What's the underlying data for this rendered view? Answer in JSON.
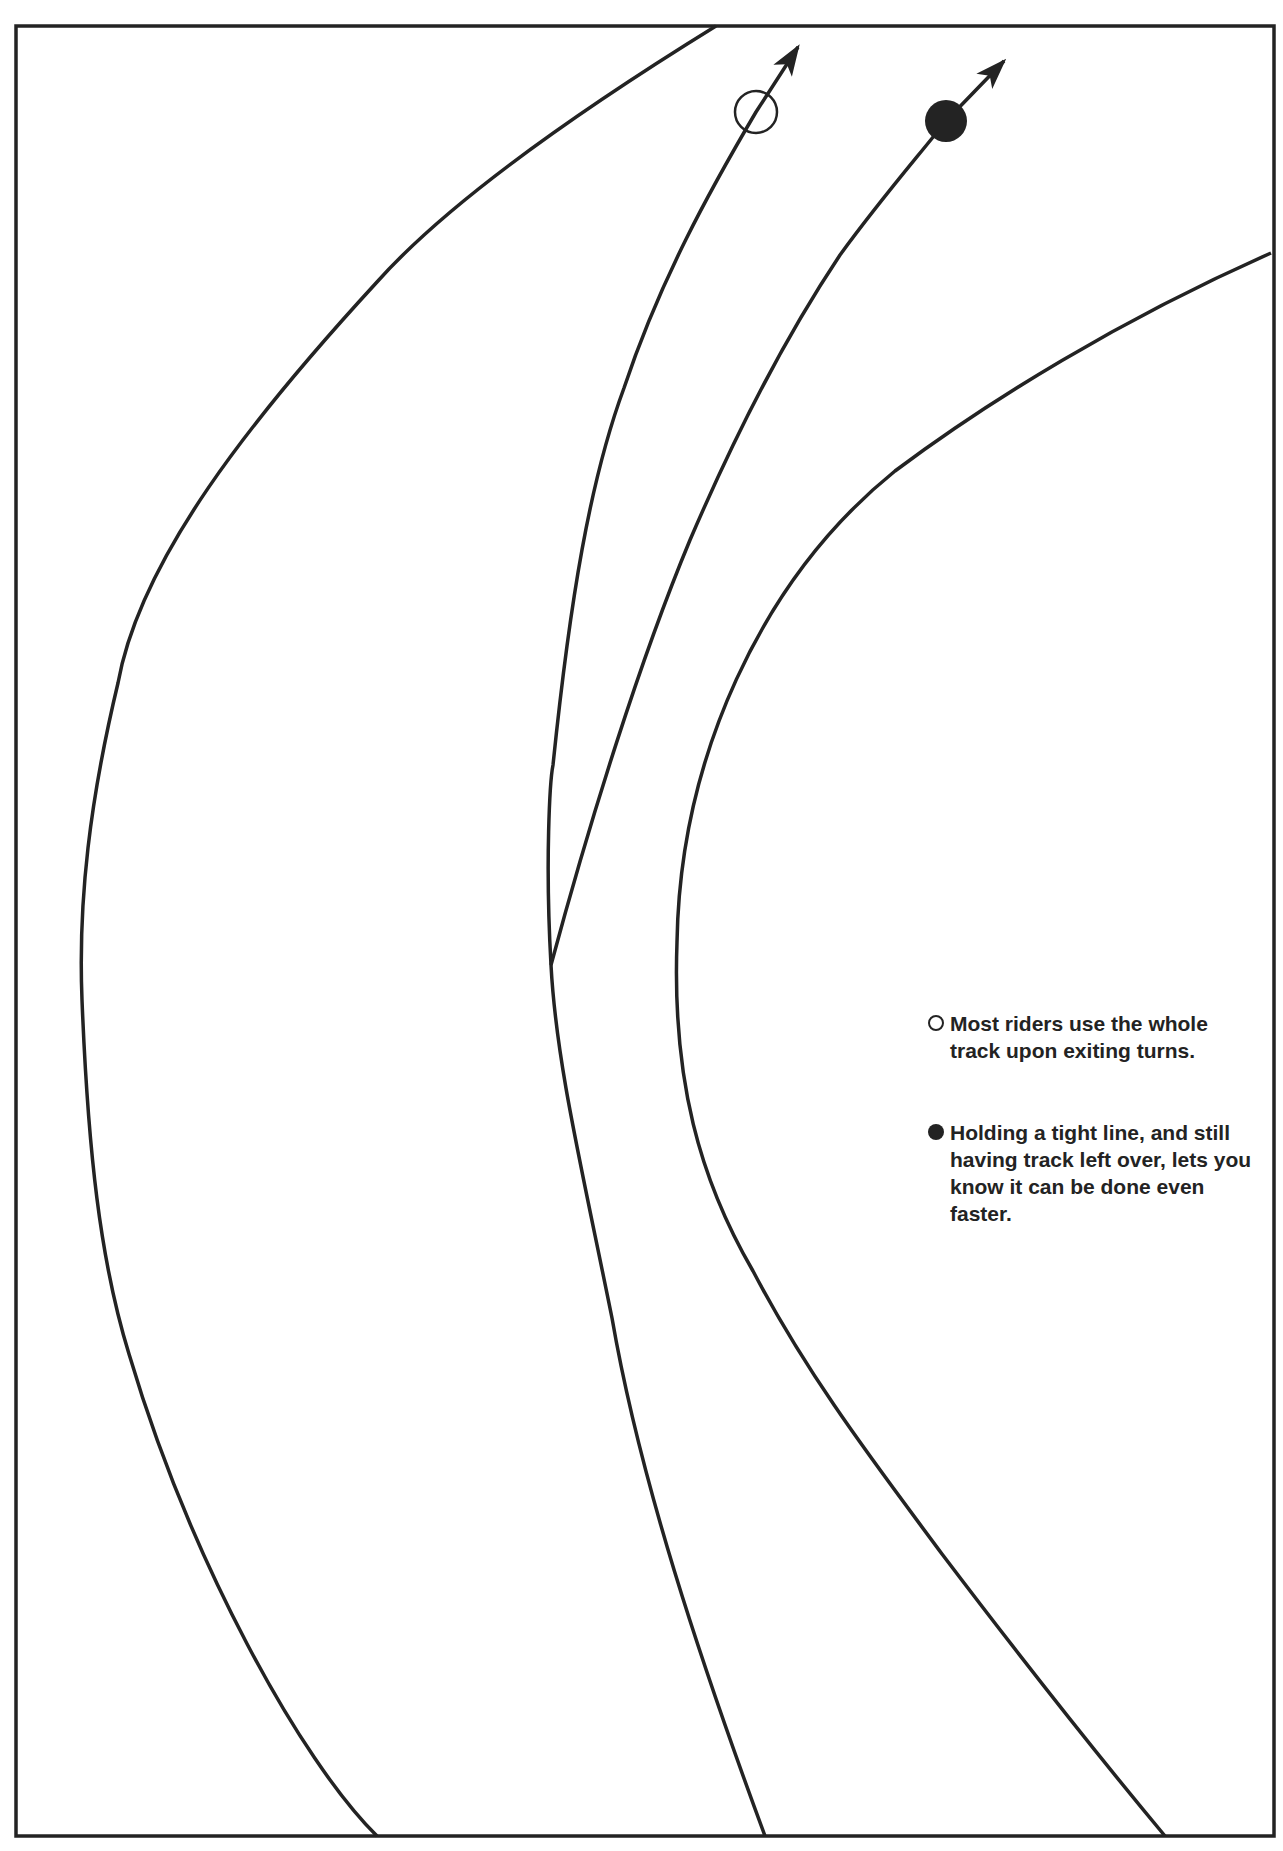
{
  "diagram": {
    "type": "racing-line-illustration",
    "colors": {
      "ink": "#232323",
      "background": "#ffffff"
    },
    "lines": [
      {
        "id": "track-left-edge",
        "role": "track boundary"
      },
      {
        "id": "track-right-edge",
        "role": "track boundary"
      },
      {
        "id": "open-circle-line",
        "marker": "open-circle",
        "role": "wide exit line using whole track"
      },
      {
        "id": "filled-circle-line",
        "marker": "filled-circle",
        "role": "tight exit line"
      }
    ]
  },
  "legend": {
    "items": [
      {
        "marker": "open-circle",
        "text": "Most riders use the whole track upon exiting turns."
      },
      {
        "marker": "filled-circle",
        "text": "Holding a tight line, and still having track left over, lets you know it can be done even faster."
      }
    ]
  }
}
